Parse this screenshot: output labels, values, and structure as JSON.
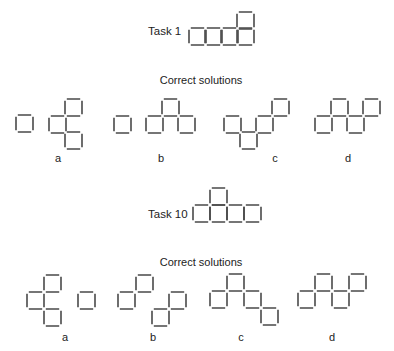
{
  "square_size": 17,
  "colors": {
    "stroke": "#4a4a4a",
    "text": "#222222",
    "background": "#ffffff"
  },
  "tasks": [
    {
      "label": "Task 1",
      "label_pos": [
        148,
        25
      ],
      "figure": [
        [
          189,
          28
        ],
        [
          205,
          28
        ],
        [
          221,
          28
        ],
        [
          237,
          28
        ],
        [
          237,
          12
        ]
      ],
      "solutions_heading": "Correct solutions",
      "heading_pos": [
        201,
        74
      ],
      "solutions": [
        {
          "label": "a",
          "label_pos": [
            58,
            152
          ],
          "squares": [
            [
              16,
              115
            ],
            [
              65,
              99
            ],
            [
              49,
              116
            ],
            [
              65,
              132
            ]
          ]
        },
        {
          "label": "b",
          "label_pos": [
            161,
            152
          ],
          "squares": [
            [
              114,
              116
            ],
            [
              146,
              116
            ],
            [
              162,
              99
            ],
            [
              178,
              116
            ]
          ]
        },
        {
          "label": "c",
          "label_pos": [
            275,
            152
          ],
          "squares": [
            [
              224,
              116
            ],
            [
              240,
              132
            ],
            [
              256,
              116
            ],
            [
              272,
              99
            ]
          ]
        },
        {
          "label": "d",
          "label_pos": [
            348,
            152
          ],
          "squares": [
            [
              315,
              116
            ],
            [
              331,
              99
            ],
            [
              347,
              116
            ],
            [
              363,
              99
            ]
          ]
        }
      ]
    },
    {
      "label": "Task 10",
      "label_pos": [
        148,
        208
      ],
      "figure": [
        [
          193,
          205
        ],
        [
          210,
          205
        ],
        [
          227,
          205
        ],
        [
          244,
          205
        ],
        [
          210,
          188
        ]
      ],
      "solutions_heading": "Correct solutions",
      "heading_pos": [
        201,
        256
      ],
      "solutions": [
        {
          "label": "a",
          "label_pos": [
            65,
            331
          ],
          "squares": [
            [
              44,
              275
            ],
            [
              27,
              292
            ],
            [
              44,
              309
            ],
            [
              78,
              292
            ]
          ]
        },
        {
          "label": "b",
          "label_pos": [
            153,
            331
          ],
          "squares": [
            [
              136,
              275
            ],
            [
              118,
              292
            ],
            [
              169,
              292
            ],
            [
              152,
              309
            ]
          ]
        },
        {
          "label": "c",
          "label_pos": [
            241,
            331
          ],
          "squares": [
            [
              210,
              291
            ],
            [
              227,
              274
            ],
            [
              244,
              291
            ],
            [
              261,
              308
            ]
          ]
        },
        {
          "label": "d",
          "label_pos": [
            332,
            331
          ],
          "squares": [
            [
              298,
              291
            ],
            [
              315,
              274
            ],
            [
              332,
              291
            ],
            [
              349,
              274
            ]
          ]
        }
      ]
    }
  ]
}
